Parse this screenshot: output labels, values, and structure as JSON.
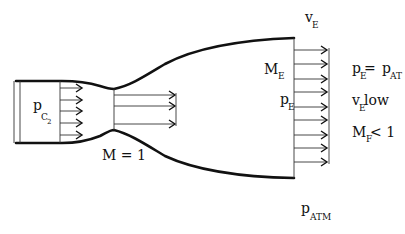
{
  "figure": {
    "labels": {
      "chamber_pressure": {
        "main": "p",
        "sub": "C",
        "subsub": "2"
      },
      "throat_mach": "M = 1",
      "exit_velocity": {
        "main": "v",
        "sub": "E"
      },
      "exit_mach": {
        "main": "M",
        "sub": "E"
      },
      "exit_pressure": {
        "main": "p",
        "sub": "E"
      },
      "atmospheric_pressure": {
        "main": "p",
        "sub": "ATM"
      }
    },
    "conditions": [
      {
        "lhs_main": "p",
        "lhs_sub": "E",
        "op": " = ",
        "rhs_main": "p",
        "rhs_sub": "AT"
      },
      {
        "lhs_main": "v",
        "lhs_sub": "E",
        "text": " low"
      },
      {
        "lhs_main": "M",
        "lhs_sub": "F",
        "text": " < 1"
      }
    ],
    "arrow_counts": {
      "chamber": 5,
      "throat": 3,
      "exit": 9
    },
    "colors": {
      "stroke": "#111111",
      "background": "#ffffff"
    }
  }
}
